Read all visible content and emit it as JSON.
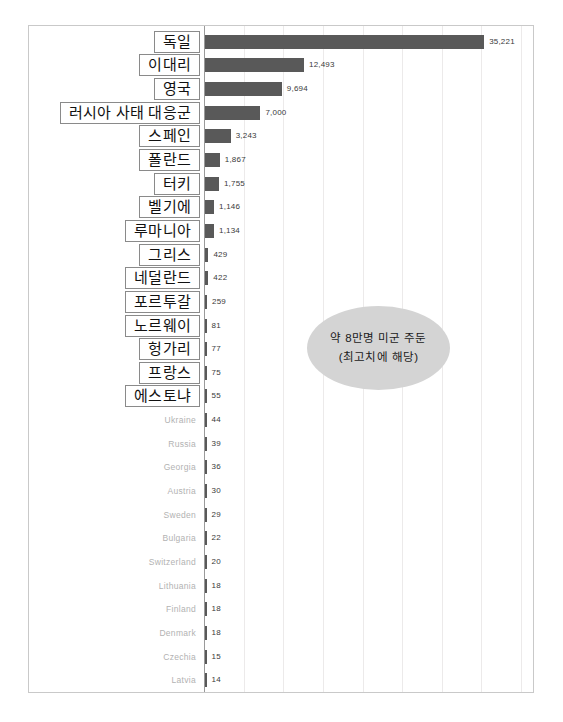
{
  "annotation": {
    "line1": "약 8만명 미군 주둔",
    "line2": "(최고치에 해당)"
  },
  "chart_data": {
    "type": "bar",
    "orientation": "horizontal",
    "title": "",
    "xlabel": "",
    "ylabel": "",
    "xlim": [
      0,
      40000
    ],
    "grid": true,
    "gridline_step": 5000,
    "legend": "none",
    "bar_color": "#595959",
    "highlight_label_style": "boxed-outline",
    "categories": [
      "독일",
      "이대리",
      "영국",
      "러시아 사태 대응군",
      "스페인",
      "폴란드",
      "터키",
      "벨기에",
      "루마니아",
      "그리스",
      "네덜란드",
      "포르투갈",
      "노르웨이",
      "헝가리",
      "프랑스",
      "에스토냐",
      "Ukraine",
      "Russia",
      "Georgia",
      "Austria",
      "Sweden",
      "Bulgaria",
      "Switzerland",
      "Lithuania",
      "Finland",
      "Denmark",
      "Czechia",
      "Latvia"
    ],
    "values": [
      35221,
      12493,
      9694,
      7000,
      3243,
      1867,
      1755,
      1146,
      1134,
      429,
      422,
      259,
      81,
      77,
      75,
      55,
      44,
      39,
      36,
      30,
      29,
      22,
      20,
      18,
      18,
      18,
      15,
      14
    ],
    "value_labels": [
      "35,221",
      "12,493",
      "9,694",
      "7,000",
      "3,243",
      "1,867",
      "1,755",
      "1,146",
      "1,134",
      "429",
      "422",
      "259",
      "81",
      "77",
      "75",
      "55",
      "44",
      "39",
      "36",
      "30",
      "29",
      "22",
      "20",
      "18",
      "18",
      "18",
      "15",
      "14"
    ],
    "boxed_count": 16
  }
}
